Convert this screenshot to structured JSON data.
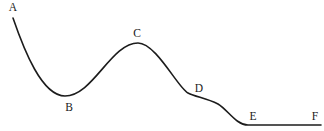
{
  "diagram": {
    "name": "labeled-curve",
    "background_color": "#ffffff",
    "curve": {
      "color": "#1c1c1c",
      "stroke_width": 1.6,
      "path": "M 13 18 C 24 50 42 96 65 96 C 93 96 111 43 138 43 C 156 43 178 88 188 93 C 196 97 206 98 218 104 C 228 110 236 125 248 125 L 321 125"
    },
    "labels": [
      {
        "text": "A",
        "x": 13,
        "y": 8
      },
      {
        "text": "B",
        "x": 69,
        "y": 108
      },
      {
        "text": "C",
        "x": 137,
        "y": 34
      },
      {
        "text": "D",
        "x": 199,
        "y": 89
      },
      {
        "text": "E",
        "x": 253,
        "y": 117
      },
      {
        "text": "F",
        "x": 315,
        "y": 117
      }
    ],
    "label_color": "#1a1a1a",
    "key_points_description": {
      "A": "start of curve, upper left",
      "B": "local minimum",
      "C": "local maximum",
      "D": "shoulder / inflection plateau",
      "E": "start of flat baseline",
      "F": "end of flat baseline, right edge"
    }
  }
}
